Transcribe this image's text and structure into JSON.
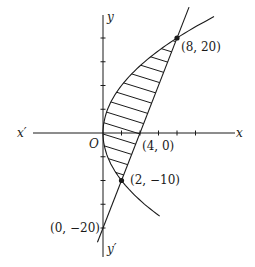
{
  "figure": {
    "axes": {
      "x_label": "x",
      "x_neg_label": "x′",
      "y_label": "y",
      "y_neg_label": "y′",
      "origin_label": "O"
    },
    "curves": [
      {
        "name": "parabola",
        "equation": "y^2 = 50x"
      },
      {
        "name": "line",
        "equation": "y = 5x - 20"
      }
    ],
    "points": [
      {
        "label": "(8, 20)",
        "x": 8,
        "y": 20,
        "marked": true
      },
      {
        "label": "(4, 0)",
        "x": 4,
        "y": 0,
        "marked": false
      },
      {
        "label": "(2, −10)",
        "x": 2,
        "y": -10,
        "marked": true
      },
      {
        "label": "(0, −20)",
        "x": 0,
        "y": -20,
        "marked": false
      }
    ],
    "shaded_region": "area between parabola and line from y = -10 to y = 20",
    "colors": {
      "ink": "#1a1a1a",
      "background": "#ffffff"
    }
  }
}
